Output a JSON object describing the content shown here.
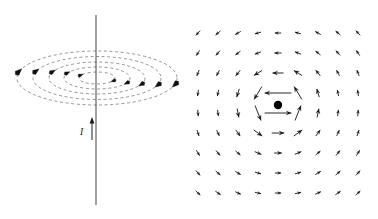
{
  "figure": {
    "background_color": "#ffffff",
    "width": 378,
    "height": 219,
    "panels": [
      {
        "id": "left-panel",
        "name": "concentric-field-lines-perspective",
        "description": "Straight vertical current-carrying wire with five concentric dashed elliptical magnetic field lines drawn in perspective, each carrying arrowheads indicating the circulation direction.",
        "wire": {
          "name": "current-carrying-wire",
          "x": 96,
          "y_top": 15,
          "y_bottom": 205,
          "color": "#555555",
          "stroke_width": 1.1
        },
        "current_label": {
          "text": "I",
          "x": 80,
          "y": 135,
          "color": "#1a1a1a"
        },
        "current_arrow": {
          "name": "current-direction-arrow",
          "x": 92,
          "y_tail": 140,
          "y_head": 117,
          "direction": "up",
          "color": "#1a1a1a"
        },
        "field_lines": {
          "name": "dashed-field-ellipses",
          "center_x": 97,
          "center_y": 78,
          "color": "#8a8a8a",
          "dash": "3 2.6",
          "stroke_width": 0.9,
          "ellipses": [
            {
              "rx": 80,
              "ry": 27
            },
            {
              "rx": 64,
              "ry": 21.5
            },
            {
              "rx": 48,
              "ry": 16
            },
            {
              "rx": 33,
              "ry": 11
            },
            {
              "rx": 18,
              "ry": 6
            }
          ]
        },
        "arrowheads_on_ellipses": 10
      },
      {
        "id": "right-panel",
        "name": "vector-field-cross-section",
        "description": "Cross-sectional view of the same magnetic field: a 9x9 grid of arrows circulating counter-clockwise about a central dot representing current flowing out of the page.",
        "grid": {
          "name": "vector-grid",
          "columns": 9,
          "rows": 9,
          "origin_x": 198,
          "origin_y": 33,
          "spacing_x": 20,
          "spacing_y": 20,
          "arrow_color": "#111111",
          "arrow_stroke_width": 0.9
        },
        "current_out_of_page_dot": {
          "name": "current-out-of-page-dot",
          "cx": 278,
          "cy": 105,
          "r": 4.2,
          "color": "#000000"
        },
        "circulation": "counter-clockwise"
      }
    ]
  },
  "chart_data": {
    "type": "scatter",
    "xlabel": "",
    "ylabel": "",
    "grid": false,
    "legend": "none",
    "series": [
      {
        "name": "field-line-ellipses",
        "kind": "dashed-ellipse",
        "center": [
          97,
          78
        ],
        "semi_axes": [
          [
            80,
            27
          ],
          [
            64,
            21.5
          ],
          [
            48,
            16
          ],
          [
            33,
            11
          ],
          [
            18,
            6
          ]
        ]
      },
      {
        "name": "vector-field-arrows",
        "kind": "quiver",
        "center": [
          278,
          105
        ],
        "grid_columns": 9,
        "grid_rows": 9,
        "spacing": [
          20,
          20
        ],
        "origin": [
          198,
          33
        ],
        "field_model": "B ∝ (−(y−yc), (x−xc)) / r",
        "circulation": "counter-clockwise"
      }
    ],
    "annotations": [
      {
        "text": "I",
        "x": 80,
        "y": 135,
        "meaning": "current magnitude/direction label"
      },
      {
        "text": "•",
        "x": 278,
        "y": 105,
        "meaning": "current out of page"
      }
    ]
  }
}
